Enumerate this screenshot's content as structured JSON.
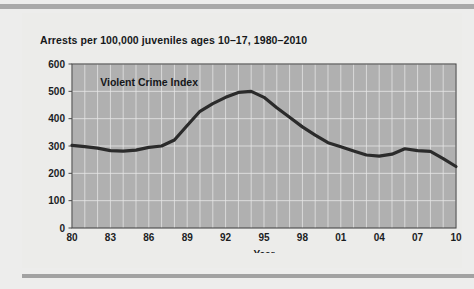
{
  "figure": {
    "title": "Arrests per 100,000 juveniles ages 10–17, 1980–2010",
    "series_label": "Violent Crime Index",
    "xlabel": "Year",
    "plot_bg_color": "#b0b0b0",
    "grid_color": "#e8e8e8",
    "line_color": "#2b2b2b",
    "frame_color": "#4a4a4a",
    "page_bg_color": "#ededec",
    "rule_color": "#a9a9a9"
  },
  "chart_data": {
    "type": "line",
    "title": "Arrests per 100,000 juveniles ages 10–17, 1980–2010",
    "xlabel": "Year",
    "ylabel": "",
    "xlim": [
      1980,
      2010
    ],
    "ylim": [
      0,
      600
    ],
    "grid": true,
    "legend": "none",
    "annotations": [
      "Violent Crime Index"
    ],
    "ytick_values": [
      0,
      100,
      200,
      300,
      400,
      500,
      600
    ],
    "ytick_labels": [
      "0",
      "100",
      "200",
      "300",
      "400",
      "500",
      "600"
    ],
    "xtick_values": [
      1980,
      1983,
      1986,
      1989,
      1992,
      1995,
      1998,
      2001,
      2004,
      2007,
      2010
    ],
    "xtick_labels": [
      "80",
      "83",
      "86",
      "89",
      "92",
      "95",
      "98",
      "01",
      "04",
      "07",
      "10"
    ],
    "x": [
      1980,
      1981,
      1982,
      1983,
      1984,
      1985,
      1986,
      1987,
      1988,
      1989,
      1990,
      1991,
      1992,
      1993,
      1994,
      1995,
      1996,
      1997,
      1998,
      1999,
      2000,
      2001,
      2002,
      2003,
      2004,
      2005,
      2006,
      2007,
      2008,
      2009,
      2010
    ],
    "series": [
      {
        "name": "Violent Crime Index",
        "values": [
          302,
          298,
          292,
          283,
          281,
          285,
          295,
          300,
          322,
          375,
          427,
          455,
          478,
          496,
          500,
          478,
          440,
          405,
          370,
          340,
          312,
          297,
          282,
          267,
          263,
          270,
          290,
          283,
          280,
          254,
          225
        ]
      }
    ]
  }
}
